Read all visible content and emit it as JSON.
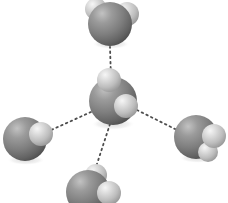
{
  "figure": {
    "width": 228,
    "height": 203,
    "background_color": "#ffffff",
    "atom_colors": {
      "oxygen_base": "#8a8a8a",
      "oxygen_highlight": "#bfbfbf",
      "oxygen_shadow": "#4a4a4a",
      "hydrogen_base": "#c9c9c9",
      "hydrogen_highlight": "#f2f2f2",
      "hydrogen_shadow": "#8f8f8f",
      "ground_shadow": "#d9d9d9",
      "bond_dot": "#4d4d4d"
    }
  },
  "molecules": [
    {
      "name": "central-water-molecule",
      "label": "H2O",
      "role": "donor-acceptor-center",
      "oxygen": {
        "cx": 113,
        "cy": 101,
        "r": 24
      },
      "hydrogens": [
        {
          "cx": 109,
          "cy": 80,
          "r": 12
        },
        {
          "cx": 126,
          "cy": 106,
          "r": 12
        }
      ],
      "shadow": {
        "cx": 113,
        "cy": 124,
        "rx": 22,
        "ry": 6
      }
    },
    {
      "name": "top-water-molecule",
      "label": "H2O",
      "role": "acceptor",
      "oxygen": {
        "cx": 110,
        "cy": 24,
        "r": 22
      },
      "hydrogens": [
        {
          "cx": 96,
          "cy": 9,
          "r": 11
        },
        {
          "cx": 127,
          "cy": 14,
          "r": 12
        }
      ],
      "shadow": {
        "cx": 111,
        "cy": 44,
        "rx": 19,
        "ry": 5
      }
    },
    {
      "name": "left-water-molecule",
      "label": "H2O",
      "role": "donor",
      "oxygen": {
        "cx": 25,
        "cy": 139,
        "r": 22
      },
      "hydrogens": [
        {
          "cx": 41,
          "cy": 134,
          "r": 12
        }
      ],
      "shadow": {
        "cx": 26,
        "cy": 160,
        "rx": 19,
        "ry": 5
      }
    },
    {
      "name": "right-water-molecule",
      "label": "H2O",
      "role": "donor",
      "oxygen": {
        "cx": 196,
        "cy": 137,
        "r": 22
      },
      "hydrogens": [
        {
          "cx": 214,
          "cy": 136,
          "r": 12
        },
        {
          "cx": 208,
          "cy": 152,
          "r": 10
        }
      ],
      "shadow": {
        "cx": 198,
        "cy": 158,
        "rx": 19,
        "ry": 5
      }
    },
    {
      "name": "bottom-water-molecule",
      "label": "H2O",
      "role": "donor",
      "oxygen": {
        "cx": 88,
        "cy": 192,
        "r": 22
      },
      "hydrogens": [
        {
          "cx": 96,
          "cy": 175,
          "r": 11
        },
        {
          "cx": 109,
          "cy": 193,
          "r": 12
        }
      ],
      "shadow": {
        "cx": 89,
        "cy": 212,
        "rx": 19,
        "ry": 5
      }
    }
  ],
  "hydrogen_bonds": [
    {
      "name": "bond-center-to-top",
      "x1": 111,
      "y1": 79,
      "x2": 110,
      "y2": 47
    },
    {
      "name": "bond-center-to-left",
      "x1": 91,
      "y1": 112,
      "x2": 49,
      "y2": 131
    },
    {
      "name": "bond-center-to-right",
      "x1": 137,
      "y1": 110,
      "x2": 179,
      "y2": 131
    },
    {
      "name": "bond-center-to-bottom",
      "x1": 110,
      "y1": 124,
      "x2": 95,
      "y2": 170
    }
  ]
}
